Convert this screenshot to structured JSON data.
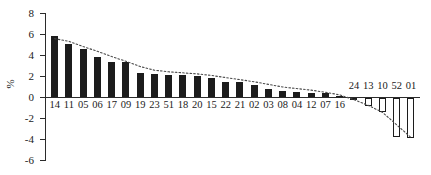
{
  "chart_data": {
    "type": "bar",
    "title": "",
    "subtitle": "",
    "xlabel": "",
    "ylabel": "%",
    "ylim": [
      -6,
      8
    ],
    "yticks": [
      8,
      6,
      4,
      2,
      0,
      -2,
      -4,
      -6
    ],
    "ytick_labels": [
      "8",
      "6",
      "4",
      "2",
      "0",
      "-2",
      "-4",
      "-6"
    ],
    "grid": false,
    "legend": null,
    "categories": [
      "14",
      "11",
      "05",
      "06",
      "17",
      "09",
      "19",
      "23",
      "51",
      "18",
      "20",
      "15",
      "22",
      "21",
      "02",
      "03",
      "08",
      "04",
      "12",
      "07",
      "16",
      "24",
      "13",
      "10",
      "52",
      "01"
    ],
    "values": [
      5.9,
      5.05,
      4.6,
      3.85,
      3.4,
      3.35,
      2.3,
      2.25,
      2.15,
      2.1,
      2.05,
      1.9,
      1.5,
      1.45,
      1.2,
      0.85,
      0.6,
      0.5,
      0.45,
      0.4,
      0.1,
      -0.25,
      -0.85,
      -1.35,
      -3.8,
      -3.85
    ],
    "bar_styles": [
      "positive-filled-black",
      "negative-hollow-outline"
    ],
    "label_positions": [
      "below-axis-for-positive",
      "above-axis-for-negative"
    ],
    "series": [
      {
        "name": "values",
        "values": [
          5.9,
          5.05,
          4.6,
          3.85,
          3.4,
          3.35,
          2.3,
          2.25,
          2.15,
          2.1,
          2.05,
          1.9,
          1.5,
          1.45,
          1.2,
          0.85,
          0.6,
          0.5,
          0.45,
          0.4,
          0.1,
          -0.25,
          -0.85,
          -1.35,
          -3.8,
          -3.85
        ]
      },
      {
        "name": "trend-line",
        "style": "dotted",
        "values": [
          5.6,
          5.35,
          4.85,
          4.4,
          3.9,
          3.45,
          2.95,
          2.6,
          2.45,
          2.35,
          2.25,
          2.1,
          1.9,
          1.7,
          1.5,
          1.25,
          1.0,
          0.85,
          0.7,
          0.5,
          0.25,
          -0.2,
          -0.75,
          -1.4,
          -2.6,
          -3.8
        ]
      }
    ],
    "colors": {
      "positive_bar": "#1c1c1c",
      "negative_bar_fill": "#ffffff",
      "negative_bar_stroke": "#1c1c1c",
      "axis": "#2b2b2b",
      "trend_line": "#4a4a4a",
      "text": "#1a1a1a",
      "background": "#ffffff"
    }
  }
}
